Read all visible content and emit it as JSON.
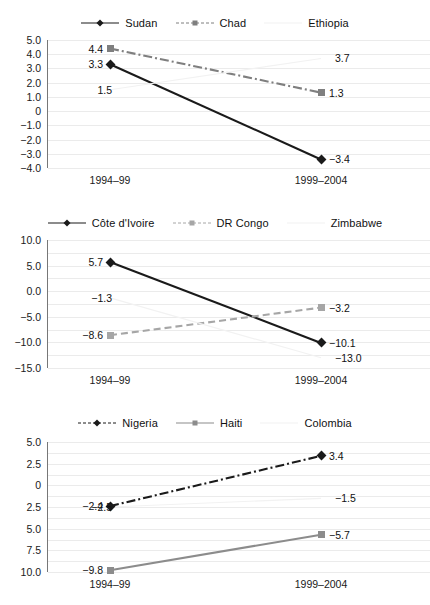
{
  "figure": {
    "background": "#ffffff",
    "panel_count": 3
  },
  "chart_data": [
    {
      "type": "line",
      "title": "",
      "xlabel": "",
      "ylabel": "",
      "categories": [
        "1994–99",
        "1999–2004"
      ],
      "x": [
        "1994–99",
        "1999–2004"
      ],
      "ylim": [
        -4.0,
        5.0
      ],
      "yticks": [
        5.0,
        4.0,
        3.0,
        2.0,
        1.0,
        0,
        -1.0,
        -2.0,
        -3.0,
        -4.0
      ],
      "ytick_labels": [
        "5.0",
        "4.0",
        "3.0",
        "2.0",
        "1.0",
        "0",
        "−1.0",
        "−2.0",
        "−3.0",
        "−4.0"
      ],
      "grid": true,
      "legend_position": "top-center",
      "series": [
        {
          "name": "Sudan",
          "values": [
            3.3,
            -3.4
          ],
          "labels": [
            "3.3",
            "−3.4"
          ],
          "color": "#1a1a1a",
          "style": "solid",
          "marker": "diamond",
          "legend_marker": "diamond"
        },
        {
          "name": "Chad",
          "values": [
            4.4,
            1.3
          ],
          "labels": [
            "4.4",
            "1.3"
          ],
          "color": "#7f7f7f",
          "style": "dashdot",
          "marker": "square",
          "legend_marker": "square"
        },
        {
          "name": "Ethiopia",
          "values": [
            1.5,
            3.7
          ],
          "labels": [
            "1.5",
            "3.7"
          ],
          "color": "#f2f2f2",
          "style": "solid",
          "marker": "none",
          "legend_marker": "none"
        }
      ]
    },
    {
      "type": "line",
      "title": "",
      "xlabel": "",
      "ylabel": "",
      "categories": [
        "1994–99",
        "1999–2004"
      ],
      "x": [
        "1994–99",
        "1999–2004"
      ],
      "ylim": [
        -15.0,
        10.0
      ],
      "yticks": [
        10.0,
        5.0,
        0.0,
        -5.0,
        -10.0,
        -15.0
      ],
      "ytick_labels": [
        "10.0",
        "5.0",
        "0.0",
        "−5.0",
        "−10.0",
        "−15.0"
      ],
      "grid": true,
      "legend_position": "top-center",
      "series": [
        {
          "name": "Côte d'Ivoire",
          "values": [
            5.7,
            -10.1
          ],
          "labels": [
            "5.7",
            "−10.1"
          ],
          "color": "#1a1a1a",
          "style": "solid",
          "marker": "diamond",
          "legend_marker": "diamond"
        },
        {
          "name": "DR Congo",
          "values": [
            -8.6,
            -3.2
          ],
          "labels": [
            "−8.6",
            "−3.2"
          ],
          "color": "#a6a6a6",
          "style": "dashed",
          "marker": "square",
          "legend_marker": "square"
        },
        {
          "name": "Zimbabwe",
          "values": [
            -1.3,
            -13.0
          ],
          "labels": [
            "−1.3",
            "−13.0"
          ],
          "color": "#f2f2f2",
          "style": "solid",
          "marker": "none",
          "legend_marker": "none"
        }
      ]
    },
    {
      "type": "line",
      "title": "",
      "xlabel": "",
      "ylabel": "",
      "categories": [
        "1994–99",
        "1999–2004"
      ],
      "x": [
        "1994–99",
        "1999–2004"
      ],
      "ylim": [
        -10.0,
        5.0
      ],
      "yticks": [
        5.0,
        2.5,
        0,
        -2.5,
        -5.0,
        -7.5,
        -10.0
      ],
      "ytick_labels": [
        "5.0",
        "2.5",
        "0",
        "2.5",
        "5.0",
        "7.5",
        "10.0"
      ],
      "grid": true,
      "legend_position": "top-center",
      "series": [
        {
          "name": "Nigeria",
          "values": [
            -2.4,
            3.4
          ],
          "labels": [
            "−2.4",
            "3.4"
          ],
          "color": "#1a1a1a",
          "style": "dashdot",
          "marker": "diamond",
          "legend_marker": "diamond"
        },
        {
          "name": "Haiti",
          "values": [
            -9.8,
            -5.7
          ],
          "labels": [
            "−9.8",
            "−5.7"
          ],
          "color": "#8c8c8c",
          "style": "solid",
          "marker": "square",
          "legend_marker": "square"
        },
        {
          "name": "Colombia",
          "values": [
            -2.5,
            -1.5
          ],
          "labels": [
            "−2.5",
            "−1.5"
          ],
          "color": "#f2f2f2",
          "style": "solid",
          "marker": "none",
          "legend_marker": "none"
        }
      ]
    }
  ]
}
